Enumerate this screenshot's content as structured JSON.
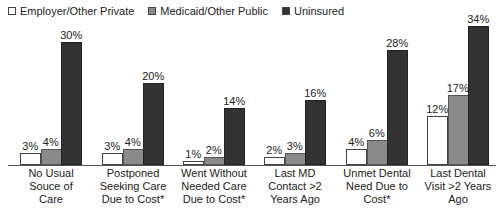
{
  "legend": [
    {
      "label": "Employer/Other Private",
      "color": "#ffffff"
    },
    {
      "label": "Medicaid/Other Public",
      "color": "#8a8a8a"
    },
    {
      "label": "Uninsured",
      "color": "#333333"
    }
  ],
  "chart_data": {
    "type": "bar",
    "title": "",
    "xlabel": "",
    "ylabel": "",
    "ylim": [
      0,
      35
    ],
    "grid": false,
    "legend_position": "top-left",
    "categories": [
      "No Usual Souce of Care",
      "Postponed Seeking Care Due to Cost*",
      "Went Without Needed Care Due to Cost*",
      "Last MD Contact >2 Years Ago",
      "Unmet Dental Need Due to Cost*",
      "Last Dental Visit >2 Years Ago"
    ],
    "series": [
      {
        "name": "Employer/Other Private",
        "values": [
          3,
          3,
          1,
          2,
          4,
          12
        ]
      },
      {
        "name": "Medicaid/Other Public",
        "values": [
          4,
          4,
          2,
          3,
          6,
          17
        ]
      },
      {
        "name": "Uninsured",
        "values": [
          30,
          20,
          14,
          16,
          28,
          34
        ]
      }
    ],
    "value_labels": [
      [
        "3%",
        "4%",
        "30%"
      ],
      [
        "3%",
        "4%",
        "20%"
      ],
      [
        "1%",
        "2%",
        "14%"
      ],
      [
        "2%",
        "3%",
        "16%"
      ],
      [
        "4%",
        "6%",
        "28%"
      ],
      [
        "12%",
        "17%",
        "34%"
      ]
    ],
    "category_lines": [
      [
        "No Usual",
        "Souce of",
        "Care"
      ],
      [
        "Postponed",
        "Seeking Care",
        "Due to Cost*"
      ],
      [
        "Went Without",
        "Needed Care",
        "Due to Cost*"
      ],
      [
        "Last MD",
        "Contact >2",
        "Years Ago"
      ],
      [
        "Unmet Dental",
        "Need Due to",
        "Cost*"
      ],
      [
        "Last Dental",
        "Visit >2 Years",
        "Ago"
      ]
    ]
  }
}
